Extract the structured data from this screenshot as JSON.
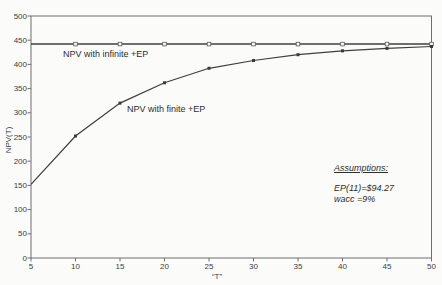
{
  "chart_data": {
    "type": "line",
    "title": "",
    "xlabel": "“T”",
    "ylabel": "NPV(T)",
    "x": [
      5,
      10,
      15,
      20,
      25,
      30,
      35,
      40,
      45,
      50
    ],
    "series": [
      {
        "name": "NPV with infinite +EP",
        "values": [
          442,
          442,
          442,
          442,
          442,
          442,
          442,
          442,
          442,
          442
        ],
        "marker": "open-square"
      },
      {
        "name": "NPV with finite +EP",
        "values": [
          152,
          252,
          320,
          362,
          392,
          408,
          420,
          428,
          433,
          437
        ],
        "marker": "filled-square"
      }
    ],
    "x_ticks": [
      5,
      10,
      15,
      20,
      25,
      30,
      35,
      40,
      45,
      50
    ],
    "y_ticks": [
      0,
      50,
      100,
      150,
      200,
      250,
      300,
      350,
      400,
      450,
      500
    ],
    "xlim": [
      5,
      50
    ],
    "ylim": [
      0,
      500
    ],
    "grid": false,
    "legend_position": "inline-labels",
    "line_color": "#3f3f3f",
    "frame_color": "#6f6f6f"
  },
  "labels": {
    "infinite_series": "NPV with infinite +EP",
    "finite_series": "NPV with finite +EP",
    "y_axis": "NPV(T)",
    "x_axis": "“T”"
  },
  "annotation": {
    "heading": "Assumptions:",
    "line1": "EP(11)=$94.27",
    "line2": "wacc =9%"
  }
}
